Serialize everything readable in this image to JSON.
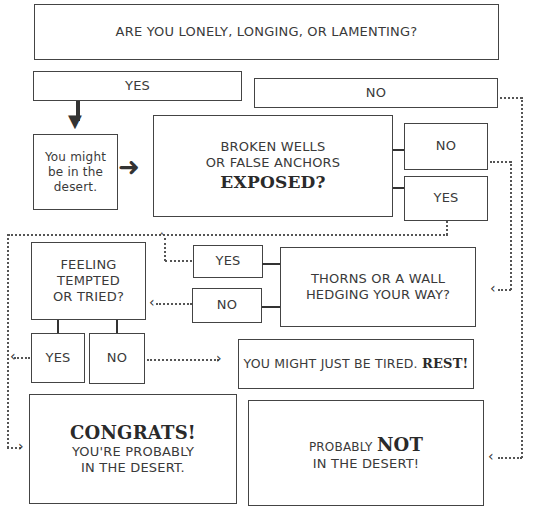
{
  "diagram": {
    "type": "flowchart",
    "nodes": {
      "q1": "ARE YOU LONELY, LONGING, OR LAMENTING?",
      "q1_yes": "YES",
      "q1_no": "NO",
      "maybe_desert": "You might be in the desert.",
      "q2_line1": "BROKEN WELLS",
      "q2_line2": "OR FALSE ANCHORS",
      "q2_emph": "EXPOSED?",
      "q2_no": "NO",
      "q2_yes": "YES",
      "q3_line1": "THORNS OR A WALL",
      "q3_line2": "HEDGING YOUR WAY?",
      "q3_yes": "YES",
      "q3_no": "NO",
      "q4_line1": "FEELING",
      "q4_line2": "TEMPTED",
      "q4_line3": "OR TRIED?",
      "q4_yes": "YES",
      "q4_no": "NO",
      "tired_text": "YOU MIGHT JUST BE TIRED.",
      "tired_emph": "REST!",
      "congrats_emph": "CONGRATS!",
      "congrats_line1": "YOU'RE PROBABLY",
      "congrats_line2": "IN THE DESERT.",
      "not_prefix": "PROBABLY",
      "not_emph": "NOT",
      "not_line2": "IN THE DESERT!"
    },
    "colors": {
      "line": "#444444",
      "text": "#3a3a3a",
      "background": "#ffffff"
    }
  }
}
